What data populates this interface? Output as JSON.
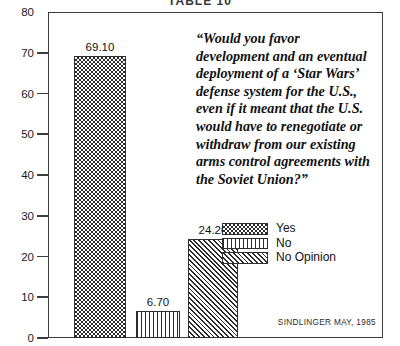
{
  "caption": "TABLE 10",
  "quote": "“Would you favor development and an eventual deployment of a ‘Star Wars’ defense system for the U.S., even if it meant that the U.S. would have to renegotiate or withdraw from our existing arms control agreements with the Soviet Union?”",
  "source": "SINDLINGER   MAY, 1985",
  "legend": {
    "items": [
      {
        "label": "Yes",
        "pattern": "checkerboard"
      },
      {
        "label": "No",
        "pattern": "vertical-stripes"
      },
      {
        "label": "No Opinion",
        "pattern": "diagonal-hatch"
      }
    ]
  },
  "chart_data": {
    "type": "bar",
    "title": "TABLE 10",
    "xlabel": "",
    "ylabel": "",
    "ylim": [
      0,
      80
    ],
    "yticks": [
      0,
      10,
      20,
      30,
      40,
      50,
      60,
      70,
      80
    ],
    "ytick_labels": [
      "0",
      "10",
      "20",
      "30",
      "40",
      "50",
      "60",
      "70",
      "80"
    ],
    "grid": false,
    "legend_position": "center-right",
    "categories": [
      "Yes",
      "No",
      "No Opinion"
    ],
    "values": [
      69.1,
      6.7,
      24.2
    ],
    "value_labels": [
      "69.10",
      "6.70",
      "24.20"
    ],
    "patterns": [
      "checkerboard",
      "vertical-stripes",
      "diagonal-hatch"
    ],
    "annotation": "“Would you favor development and an eventual deployment of a ‘Star Wars’ defense system for the U.S., even if it meant that the U.S. would have to renegotiate or withdraw from our existing arms control agreements with the Soviet Union?”",
    "source": "SINDLINGER   MAY, 1985"
  }
}
